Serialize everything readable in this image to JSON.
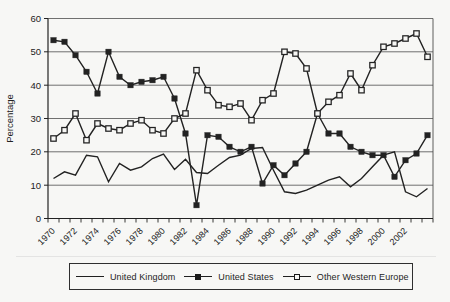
{
  "colors": {
    "paper": "#f7f7f5",
    "ink": "#222222",
    "grid": "#4d4d4d"
  },
  "chart_data": {
    "type": "line",
    "title": "",
    "xlabel": "",
    "ylabel": "Percentage",
    "ylim": [
      0,
      60
    ],
    "y_ticks": [
      0,
      10,
      20,
      30,
      40,
      50,
      60
    ],
    "grid": true,
    "legend_position": "bottom",
    "x": [
      1970,
      1971,
      1972,
      1973,
      1974,
      1975,
      1976,
      1977,
      1978,
      1979,
      1980,
      1981,
      1982,
      1983,
      1984,
      1985,
      1986,
      1987,
      1988,
      1989,
      1990,
      1991,
      1992,
      1993,
      1994,
      1995,
      1996,
      1997,
      1998,
      1999,
      2000,
      2001,
      2002,
      2003,
      2004
    ],
    "x_label_years": [
      1970,
      1972,
      1974,
      1976,
      1978,
      1980,
      1982,
      1984,
      1986,
      1988,
      1990,
      1992,
      1994,
      1996,
      1998,
      2000,
      2002
    ],
    "series": [
      {
        "name": "United Kingdom",
        "marker": "none",
        "values": [
          12,
          14,
          13,
          19,
          18.5,
          11,
          16.5,
          14.5,
          15.5,
          18,
          19.3,
          14.7,
          17.8,
          13.8,
          13.5,
          16,
          18.3,
          19,
          21,
          21.3,
          14.5,
          8,
          7.5,
          8.5,
          10,
          11.5,
          12.5,
          9.5,
          12,
          15.5,
          19,
          20,
          8,
          6.5,
          9
        ]
      },
      {
        "name": "United States",
        "marker": "filled-square",
        "values": [
          53.5,
          53,
          49,
          44,
          37.5,
          50,
          42.5,
          40,
          41,
          41.5,
          42.5,
          36,
          25.5,
          4,
          25,
          24.5,
          21.5,
          20,
          21.5,
          10.5,
          16,
          13,
          16.5,
          20,
          31.5,
          25.5,
          25.5,
          21.5,
          20,
          19,
          19,
          12.5,
          17.5,
          19.5,
          25
        ]
      },
      {
        "name": "Other Western Europe",
        "marker": "open-square",
        "values": [
          24,
          26.5,
          31.5,
          23.5,
          28.5,
          27,
          26.5,
          28.5,
          29.5,
          26.5,
          25.5,
          30,
          31.5,
          44.5,
          38.5,
          34,
          33.5,
          34.5,
          29.5,
          35.5,
          37.5,
          50,
          49.5,
          45,
          31.5,
          35,
          37,
          43.5,
          38.5,
          46,
          51.5,
          52.5,
          54,
          55.5,
          48.5
        ]
      }
    ]
  }
}
